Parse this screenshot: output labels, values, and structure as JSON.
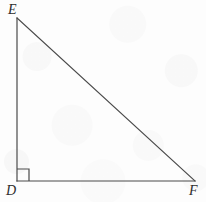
{
  "figure": {
    "type": "right-triangle-diagram",
    "background_color": "#fdfdfd",
    "stroke_color": "#4a4a4a",
    "label_color": "#2e2e2e",
    "stroke_width": 1.2,
    "canvas": {
      "width": 206,
      "height": 202
    },
    "vertices": [
      {
        "name": "E",
        "label": "E",
        "x": 17,
        "y": 18,
        "label_x": 8,
        "label_y": 3,
        "label_position": "above-right"
      },
      {
        "name": "D",
        "label": "D",
        "x": 17,
        "y": 181,
        "label_x": 6,
        "label_y": 184,
        "label_position": "below-left"
      },
      {
        "name": "F",
        "label": "F",
        "x": 195,
        "y": 181,
        "label_x": 189,
        "label_y": 184,
        "label_position": "below-right"
      }
    ],
    "edges": [
      {
        "name": "leg-DE",
        "from": "D",
        "to": "E",
        "x1": 17,
        "y1": 181,
        "x2": 17,
        "y2": 18
      },
      {
        "name": "leg-DF",
        "from": "D",
        "to": "F",
        "x1": 17,
        "y1": 181,
        "x2": 195,
        "y2": 181
      },
      {
        "name": "hypotenuse-EF",
        "from": "E",
        "to": "F",
        "x1": 17,
        "y1": 18,
        "x2": 195,
        "y2": 181
      }
    ],
    "right_angle_marker": {
      "at_vertex": "D",
      "size": 12,
      "x": 17,
      "y": 169,
      "path": "M 17 169 L 29 169 L 29 181"
    }
  }
}
